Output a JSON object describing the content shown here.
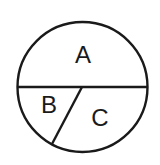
{
  "diagram": {
    "type": "circle-partition",
    "stroke_color": "#1a1a1a",
    "background": "#ffffff",
    "circle": {
      "cx": 82.5,
      "cy": 87,
      "r": 65
    },
    "diameter": {
      "x1": 17.5,
      "y1": 87,
      "x2": 147.5,
      "y2": 87
    },
    "chord": {
      "x1": 82,
      "y1": 87,
      "x2": 52,
      "y2": 144
    },
    "regions": [
      {
        "id": "A",
        "label": "A",
        "x": 83,
        "y": 55
      },
      {
        "id": "B",
        "label": "B",
        "x": 49,
        "y": 105
      },
      {
        "id": "C",
        "label": "C",
        "x": 100,
        "y": 118
      }
    ]
  }
}
